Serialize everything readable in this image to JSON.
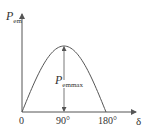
{
  "chart_data": {
    "type": "line",
    "title": "",
    "xlabel": "δ",
    "ylabel": "P_em",
    "x_ticks": [
      "0",
      "90°",
      "180°"
    ],
    "x": [
      0,
      30,
      60,
      90,
      120,
      150,
      180
    ],
    "series": [
      {
        "name": "P_em = P_emmax · sin δ",
        "values": [
          0,
          0.5,
          0.866,
          1,
          0.866,
          0.5,
          0
        ]
      }
    ],
    "annotations": [
      {
        "text": "P_emmax",
        "at_x": 90,
        "description": "double-headed vertical arrow from axis to peak"
      }
    ],
    "xlim": [
      0,
      180
    ],
    "ylim": [
      0,
      1
    ],
    "grid": false,
    "legend": "none"
  },
  "labels": {
    "y_axis_main": "P",
    "y_axis_sub": "em",
    "x_axis": "δ",
    "origin": "0",
    "tick_90": "90°",
    "tick_180": "180°",
    "peak_main": "P",
    "peak_sub": "emmax"
  },
  "colors": {
    "line": "#555555",
    "text": "#333333"
  }
}
